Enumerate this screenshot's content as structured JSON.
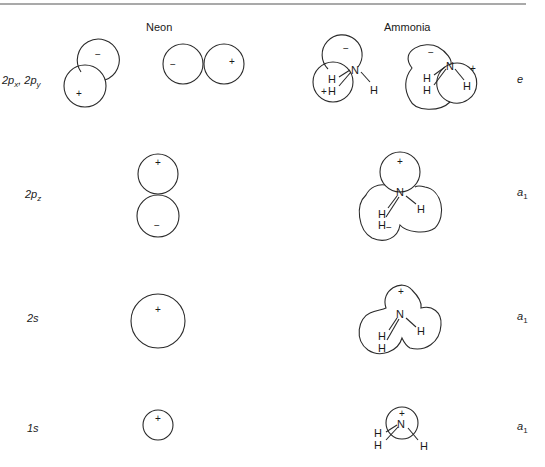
{
  "columns": {
    "neon": "Neon",
    "ammonia": "Ammonia"
  },
  "rows": [
    {
      "orbital_label": "2p",
      "orbital_label_sub": "x",
      "orbital_label_sep": ", 2p",
      "orbital_label_sub2": "y",
      "symmetry": "e",
      "symmetry_sub": ""
    },
    {
      "orbital_label": "2p",
      "orbital_label_sub": "z",
      "symmetry": "a",
      "symmetry_sub": "1"
    },
    {
      "orbital_label": "2s",
      "symmetry": "a",
      "symmetry_sub": "1"
    },
    {
      "orbital_label": "1s",
      "symmetry": "a",
      "symmetry_sub": "1"
    }
  ],
  "signs": {
    "plus": "+",
    "minus": "−"
  },
  "atoms": {
    "nitrogen": "N",
    "hydrogen": "H"
  },
  "colors": {
    "line": "#2a2a2a",
    "text": "#1a1a1a",
    "background": "#ffffff",
    "rule": "#555555"
  }
}
